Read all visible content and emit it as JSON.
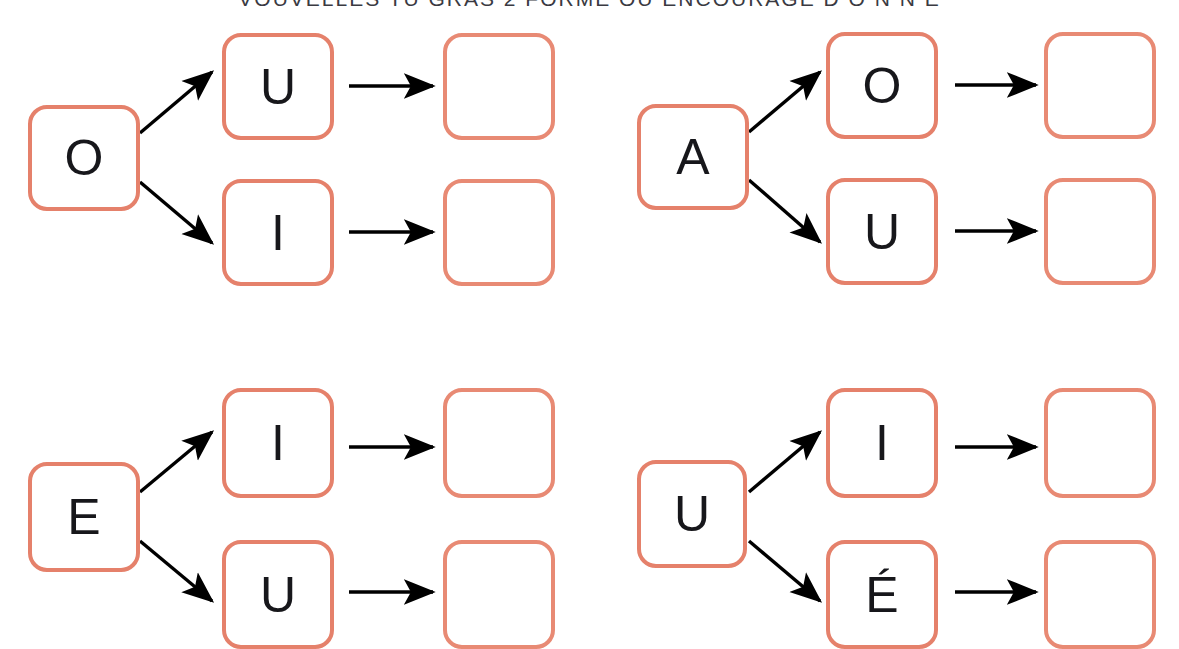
{
  "document": {
    "title_clipped": "VOUVELLES TU GRAS 2 FORME OU ENCOURAGE  D O N N E",
    "background_color": "#ffffff",
    "box_border_color": "#e5816b",
    "arrow_color": "#000000",
    "letter_color": "#17171b"
  },
  "exercises": [
    {
      "id": "exercise-1",
      "source": {
        "label": "O"
      },
      "branches": [
        {
          "label": "U",
          "answer": ""
        },
        {
          "label": "I",
          "answer": ""
        }
      ]
    },
    {
      "id": "exercise-2",
      "source": {
        "label": "A"
      },
      "branches": [
        {
          "label": "O",
          "answer": ""
        },
        {
          "label": "U",
          "answer": ""
        }
      ]
    },
    {
      "id": "exercise-3",
      "source": {
        "label": "E"
      },
      "branches": [
        {
          "label": "I",
          "answer": ""
        },
        {
          "label": "U",
          "answer": ""
        }
      ]
    },
    {
      "id": "exercise-4",
      "source": {
        "label": "U"
      },
      "branches": [
        {
          "label": "I",
          "answer": ""
        },
        {
          "label": "É",
          "answer": ""
        }
      ]
    }
  ]
}
